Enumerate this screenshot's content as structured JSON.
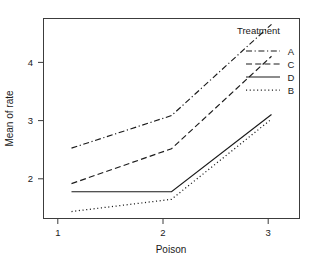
{
  "chart_data": {
    "type": "line",
    "title": "",
    "subtitle": "",
    "xlabel": "Poison",
    "ylabel": "Mean of rate",
    "categories": [
      "1",
      "2",
      "3"
    ],
    "x": [
      1,
      2,
      3
    ],
    "xlim": [
      0.72,
      3.28
    ],
    "ylim": [
      1.28,
      4.72
    ],
    "xticks": [
      "1",
      "2",
      "3"
    ],
    "yticks": [
      "2",
      "3",
      "4"
    ],
    "ytick_values": [
      2,
      3,
      4
    ],
    "grid": false,
    "legend_position": "top-right-inside",
    "legend_title": "Treatment",
    "series": [
      {
        "name": "A",
        "values": [
          2.49,
          3.05,
          4.62
        ],
        "linestyle": "dashdot",
        "color": "#1a1a1a"
      },
      {
        "name": "C",
        "values": [
          1.88,
          2.48,
          4.07
        ],
        "linestyle": "dashed",
        "color": "#1a1a1a"
      },
      {
        "name": "D",
        "values": [
          1.74,
          1.74,
          3.07
        ],
        "linestyle": "solid",
        "color": "#1a1a1a"
      },
      {
        "name": "B",
        "values": [
          1.4,
          1.61,
          2.99
        ],
        "linestyle": "dotted",
        "color": "#1a1a1a"
      }
    ]
  },
  "axes": {
    "x_title": "Poison",
    "y_title": "Mean of rate",
    "x_tick_labels": [
      "1",
      "2",
      "3"
    ],
    "y_tick_labels": [
      "2",
      "3",
      "4"
    ]
  },
  "legend": {
    "title": "Treatment",
    "entries": [
      {
        "label": "A",
        "style": "dashdot"
      },
      {
        "label": "C",
        "style": "dashed"
      },
      {
        "label": "D",
        "style": "solid"
      },
      {
        "label": "B",
        "style": "dotted"
      }
    ]
  },
  "colors": {
    "frame": "#3c3c3c",
    "ink": "#1a1a1a",
    "background": "#ffffff"
  }
}
